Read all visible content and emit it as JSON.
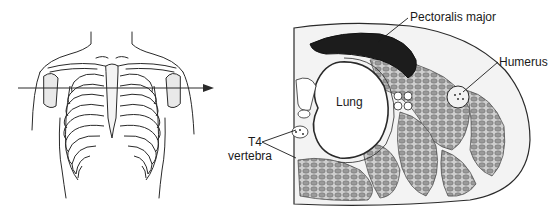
{
  "figure": {
    "left_panel": {
      "description": "Anterior view of thorax with rib cage, with horizontal arrow marking section level",
      "arrow": "horizontal-section-arrow"
    },
    "right_panel": {
      "description": "Transverse cross-section of thorax at T4 level",
      "labels": {
        "pectoralis": "Pectoralis major",
        "humerus": "Humerus",
        "lung": "Lung",
        "t4": "T4",
        "vertebra": "vertebra"
      }
    },
    "colors": {
      "line": "#2a2a2a",
      "muscle_dark": "#1c1c1c",
      "muscle_fill": "#8a8a8a",
      "background": "#ffffff"
    }
  }
}
